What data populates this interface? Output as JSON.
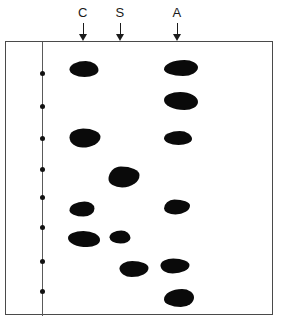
{
  "figure": {
    "name": "thin-layer-chromatography-plate",
    "background_color": "#ffffff",
    "frame_color": "#4a4a4a",
    "spot_color": "#0a0a0a",
    "marker_line_color": "#5a5a5a"
  },
  "lanes": [
    {
      "id": "lane-c",
      "label": "C",
      "x": 83,
      "arrow": "down-arrow-icon"
    },
    {
      "id": "lane-s",
      "label": "S",
      "x": 120,
      "arrow": "down-arrow-icon"
    },
    {
      "id": "lane-a",
      "label": "A",
      "x": 177,
      "arrow": "down-arrow-icon"
    }
  ],
  "chart_data": {
    "type": "scatter",
    "title": "",
    "xlabel": "",
    "ylabel": "",
    "plot_kind": "thin-layer-chromatogram",
    "plate": {
      "left": 5,
      "top": 41,
      "width": 268,
      "height": 274
    },
    "marker_line": {
      "x": 36,
      "dot_count": 8,
      "dots_y": [
        31,
        64,
        96,
        127,
        155,
        185,
        219,
        249
      ]
    },
    "series": [
      {
        "name": "C",
        "lane_x": 83,
        "spots": [
          {
            "x": 83,
            "y": 68,
            "w": 29,
            "h": 16,
            "shape": "s0"
          },
          {
            "x": 84,
            "y": 137,
            "w": 31,
            "h": 19,
            "shape": "s1"
          },
          {
            "x": 81,
            "y": 208,
            "w": 25,
            "h": 15,
            "shape": "s2"
          },
          {
            "x": 83,
            "y": 238,
            "w": 32,
            "h": 16,
            "shape": "s3"
          }
        ]
      },
      {
        "name": "S",
        "lane_x": 120,
        "spots": [
          {
            "x": 123,
            "y": 176,
            "w": 31,
            "h": 21,
            "shape": "s4"
          },
          {
            "x": 119,
            "y": 236,
            "w": 21,
            "h": 13,
            "shape": "s0"
          },
          {
            "x": 133,
            "y": 268,
            "w": 29,
            "h": 16,
            "shape": "s1"
          }
        ]
      },
      {
        "name": "A",
        "lane_x": 177,
        "spots": [
          {
            "x": 180,
            "y": 67,
            "w": 34,
            "h": 16,
            "shape": "s2"
          },
          {
            "x": 180,
            "y": 100,
            "w": 34,
            "h": 18,
            "shape": "s3"
          },
          {
            "x": 177,
            "y": 137,
            "w": 28,
            "h": 14,
            "shape": "s0"
          },
          {
            "x": 176,
            "y": 206,
            "w": 26,
            "h": 15,
            "shape": "s4"
          },
          {
            "x": 174,
            "y": 265,
            "w": 29,
            "h": 15,
            "shape": "s1"
          },
          {
            "x": 178,
            "y": 297,
            "w": 30,
            "h": 18,
            "shape": "s2"
          }
        ]
      }
    ]
  }
}
